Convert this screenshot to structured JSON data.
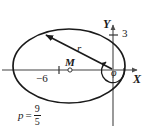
{
  "figure": {
    "kind": "ellipse-polar-coordinate-diagram",
    "background_color": "#ffffff",
    "stroke_color": "#1a1a1a",
    "axis_color": "#808080",
    "axes": {
      "x_label": "X",
      "y_label": "Y",
      "origin_px": [
        113,
        70
      ]
    },
    "ticks": [
      {
        "name": "y-tick-3",
        "label": "3",
        "axis": "y",
        "value": 3,
        "px": [
          113,
          35
        ]
      },
      {
        "name": "x-tick-minus-6",
        "label": "−6",
        "axis": "x",
        "value": -6,
        "px": [
          70,
          70
        ]
      }
    ],
    "points": [
      {
        "name": "center",
        "label": "M",
        "px": [
          70,
          70
        ]
      }
    ],
    "vectors": [
      {
        "name": "radius-vector",
        "label": "r",
        "from_px": [
          113,
          70
        ],
        "to_px": [
          44,
          34
        ]
      }
    ],
    "angles": [
      {
        "name": "polar-angle",
        "label": "φ",
        "vertex_px": [
          113,
          70
        ]
      }
    ],
    "annotations": [
      {
        "name": "semi-latus-rectum",
        "symbol": "p",
        "equals": "=",
        "numerator": "9",
        "denominator": "5",
        "text": "p = 9/5"
      }
    ],
    "ellipse": {
      "center_px": [
        70,
        66
      ],
      "semi_major_px": 56,
      "semi_minor_px": 37
    }
  }
}
